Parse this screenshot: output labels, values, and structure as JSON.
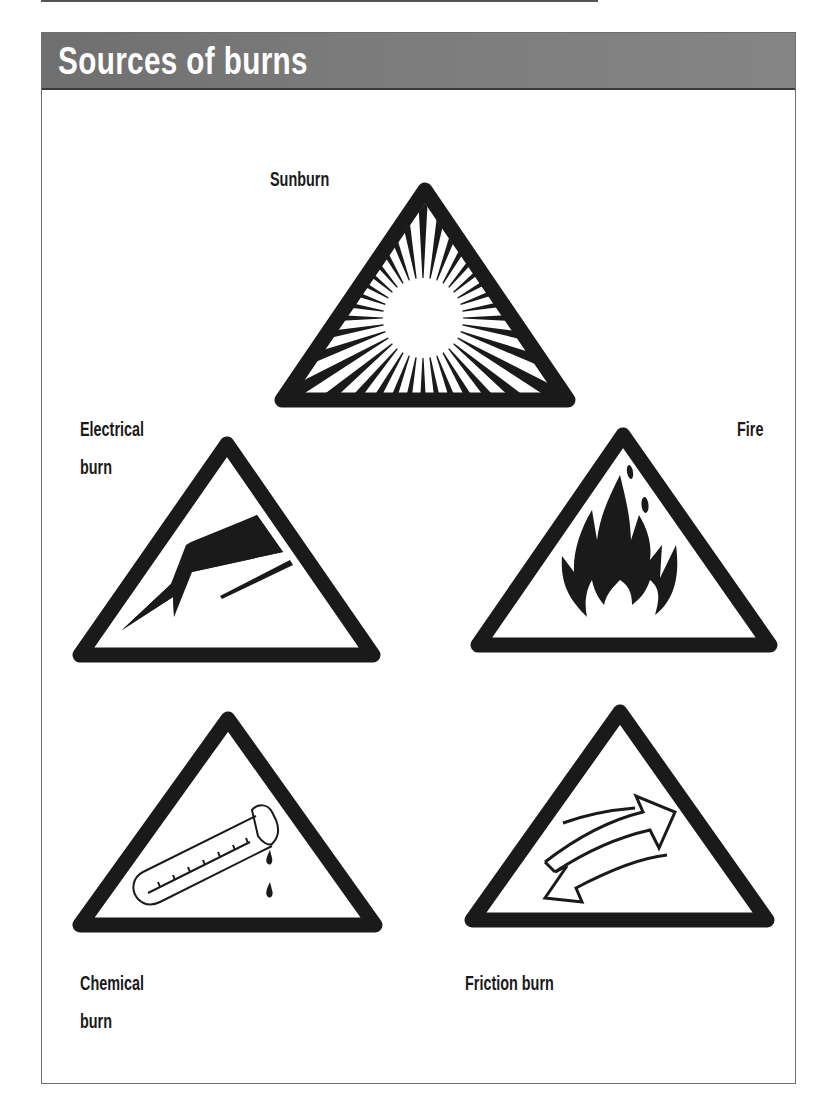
{
  "header": {
    "title": "Sources of burns"
  },
  "colors": {
    "header_background": "#7a7a7a",
    "header_text": "#ffffff",
    "sign_stroke": "#1a1a1a",
    "sign_fill": "#ffffff",
    "panel_border": "#6e6e6e"
  },
  "signs": [
    {
      "id": "sunburn",
      "label_line1": "Sunburn",
      "label_line2": "",
      "icon": "sun-icon"
    },
    {
      "id": "electrical",
      "label_line1": "Electrical",
      "label_line2": "burn",
      "icon": "lightning-bolt-icon"
    },
    {
      "id": "fire",
      "label_line1": "Fire",
      "label_line2": "",
      "icon": "flame-icon"
    },
    {
      "id": "chemical",
      "label_line1": "Chemical",
      "label_line2": "burn",
      "icon": "test-tube-icon"
    },
    {
      "id": "friction",
      "label_line1": "Friction burn",
      "label_line2": "",
      "icon": "friction-arrows-icon"
    }
  ]
}
